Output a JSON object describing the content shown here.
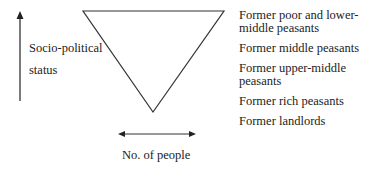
{
  "yaxis": {
    "label_line1": "Socio-political",
    "label_line2": "status"
  },
  "xaxis": {
    "label": "No. of people"
  },
  "categories": [
    {
      "line1": "Former poor and lower-",
      "line2": "middle peasants"
    },
    {
      "line1": "Former middle peasants",
      "line2": ""
    },
    {
      "line1": "Former upper-middle",
      "line2": "peasants"
    },
    {
      "line1": "Former rich peasants",
      "line2": ""
    },
    {
      "line1": "Former landlords",
      "line2": ""
    }
  ]
}
